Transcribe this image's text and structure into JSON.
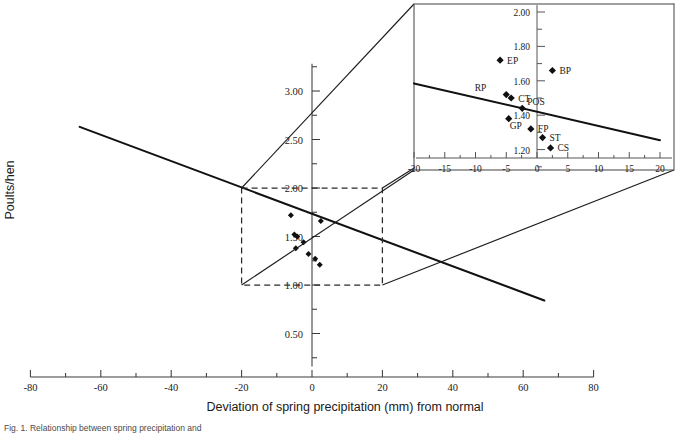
{
  "figure": {
    "caption_fragment": "Fig. 1.  Relationship between spring precipitation and"
  },
  "chart_data": {
    "type": "scatter",
    "title": "",
    "xlabel": "Deviation of spring precipitation (mm) from normal",
    "ylabel": "Poults/hen",
    "xlim": [
      -80,
      80
    ],
    "ylim": [
      0.0,
      3.25
    ],
    "xticks": [
      -80,
      -60,
      -40,
      -20,
      0,
      20,
      40,
      60,
      80
    ],
    "xticklabels": [
      "-80",
      "-60",
      "-40",
      "-20",
      "0",
      "20",
      "40",
      "60",
      "80"
    ],
    "yticks": [
      0.5,
      1.0,
      1.5,
      2.0,
      2.5,
      3.0
    ],
    "yticklabels": [
      "0.50",
      "1.00",
      "1.50",
      "2.00",
      "2.50",
      "3.00"
    ],
    "grid": false,
    "legend": "none",
    "regression_line": {
      "label": "fitted regression",
      "x_start": -66,
      "y_start": 2.63,
      "x_end": 66,
      "y_end": 0.84
    },
    "zoom_box": {
      "label": "detail region",
      "x_min": -20,
      "x_max": 20,
      "y_min": 1.0,
      "y_max": 2.0,
      "style": "dashed"
    },
    "points": [
      {
        "label": "EP",
        "x": -6.0,
        "y": 1.72
      },
      {
        "label": "BP",
        "x": 2.5,
        "y": 1.66
      },
      {
        "label": "RP",
        "x": -5.0,
        "y": 1.52
      },
      {
        "label": "CT",
        "x": -4.2,
        "y": 1.5
      },
      {
        "label": "POS",
        "x": -2.4,
        "y": 1.44
      },
      {
        "label": "GP",
        "x": -4.6,
        "y": 1.38
      },
      {
        "label": "FP",
        "x": -1.0,
        "y": 1.32
      },
      {
        "label": "ST",
        "x": 0.9,
        "y": 1.27
      },
      {
        "label": "CS",
        "x": 2.2,
        "y": 1.21
      }
    ]
  },
  "inset": {
    "name": "magnified-detail-panel",
    "type": "scatter",
    "xlim": [
      -20,
      20
    ],
    "ylim": [
      1.1,
      2.05
    ],
    "xticks": [
      -20,
      -15,
      -10,
      -5,
      0,
      5,
      10,
      15,
      20
    ],
    "xticklabels": [
      "-20",
      "-15",
      "-10",
      "-5",
      "0",
      "5",
      "10",
      "15",
      "20"
    ],
    "yticks": [
      1.2,
      1.4,
      1.6,
      1.8,
      2.0
    ],
    "yticklabels": [
      "1.20",
      "1.40",
      "1.60",
      "1.80",
      "2.00"
    ],
    "regression_line": {
      "x_start": -20,
      "y_start": 1.585,
      "x_end": 20,
      "y_end": 1.255
    },
    "points": [
      {
        "label": "EP",
        "x": -6.0,
        "y": 1.72,
        "label_dx": 7,
        "label_dy": 3.5
      },
      {
        "label": "BP",
        "x": 2.5,
        "y": 1.66,
        "label_dx": 7,
        "label_dy": 3.5
      },
      {
        "label": "RP",
        "x": -5.0,
        "y": 1.52,
        "label_dx": -20,
        "label_dy": -4.0
      },
      {
        "label": "CT",
        "x": -4.2,
        "y": 1.5,
        "label_dx": 7,
        "label_dy": 3.5
      },
      {
        "label": "POS",
        "x": -2.4,
        "y": 1.44,
        "label_dx": 5,
        "label_dy": -3.5
      },
      {
        "label": "GP",
        "x": -4.6,
        "y": 1.38,
        "label_dx": 1,
        "label_dy": 10.0
      },
      {
        "label": "FP",
        "x": -1.0,
        "y": 1.32,
        "label_dx": 7,
        "label_dy": 3.5
      },
      {
        "label": "ST",
        "x": 0.9,
        "y": 1.27,
        "label_dx": 7,
        "label_dy": 3.5
      },
      {
        "label": "CS",
        "x": 2.2,
        "y": 1.21,
        "label_dx": 7,
        "label_dy": 3.5
      }
    ]
  },
  "colors": {
    "ink": "#1a1a1a",
    "axis": "#3a3a3a",
    "inset_axis": "#555555",
    "marker": "#101010",
    "background": "#ffffff"
  }
}
